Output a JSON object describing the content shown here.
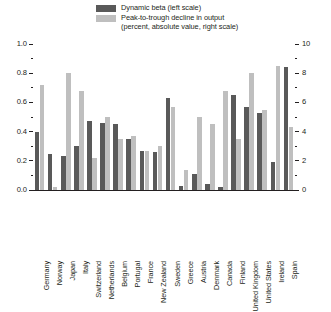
{
  "legend": {
    "items": [
      {
        "label": "Dynamic beta (left scale)",
        "sublabel": "",
        "color": "#595959",
        "icon": "legend-swatch"
      },
      {
        "label": "Peak-to-trough decline in output",
        "sublabel": "(percent, absolute value, right scale)",
        "color": "#bfbfbf",
        "icon": "legend-swatch"
      }
    ]
  },
  "axes": {
    "left": {
      "ticks": [
        "0.0",
        "0.2",
        "0.4",
        "0.6",
        "0.8",
        "1.0"
      ],
      "min": 0.0,
      "max": 1.0,
      "step": 0.2,
      "minor_step": 0.1
    },
    "right": {
      "ticks": [
        "0",
        "2",
        "4",
        "6",
        "8",
        "10"
      ],
      "min": 0,
      "max": 10,
      "step": 2,
      "minor_step": 1
    }
  },
  "chart_data": {
    "type": "bar",
    "title": "",
    "subtitle": "",
    "xlabel": "",
    "ylabel": "",
    "ylim": [
      0,
      1.0
    ],
    "y2lim": [
      0,
      10
    ],
    "grid": false,
    "legend_position": "top-center",
    "categories": [
      "Germany",
      "Norway",
      "Japan",
      "Italy",
      "Switzerland",
      "Netherlands",
      "Belgium",
      "Portugal",
      "France",
      "New Zealand",
      "Sweden",
      "Greece",
      "Austria",
      "Denmark",
      "Canada",
      "Finland",
      "United Kingdom",
      "United States",
      "Ireland",
      "Spain"
    ],
    "series": [
      {
        "name": "Dynamic beta (left scale)",
        "axis": "left",
        "color": "#595959",
        "values": [
          0.4,
          0.25,
          0.23,
          0.3,
          0.47,
          0.46,
          0.45,
          0.35,
          0.27,
          0.26,
          0.63,
          0.03,
          0.11,
          0.04,
          0.02,
          0.65,
          0.57,
          0.53,
          0.19,
          0.84
        ]
      },
      {
        "name": "Peak-to-trough decline in output (percent, absolute value, right scale)",
        "axis": "right",
        "color": "#bfbfbf",
        "values": [
          7.2,
          0.2,
          8.0,
          6.8,
          2.2,
          5.0,
          3.5,
          3.7,
          2.7,
          3.0,
          5.7,
          1.4,
          5.0,
          4.5,
          6.8,
          3.5,
          8.0,
          5.5,
          8.5,
          4.3
        ]
      }
    ]
  }
}
